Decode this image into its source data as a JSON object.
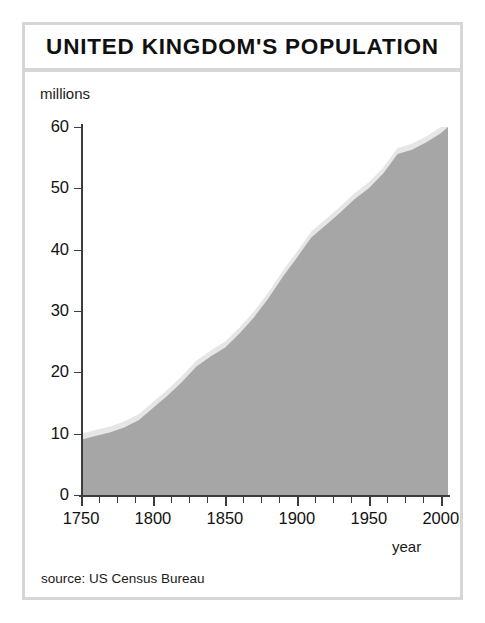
{
  "figure": {
    "title": "UNITED KINGDOM'S POPULATION",
    "source_note": "source: US Census Bureau",
    "frame_color": "#d6d6d6",
    "background_color": "#ffffff"
  },
  "chart_data": {
    "type": "area",
    "title": "UNITED KINGDOM'S POPULATION",
    "xlabel": "year",
    "ylabel": "millions",
    "xlim": [
      1750,
      2005
    ],
    "ylim": [
      0,
      60
    ],
    "grid": false,
    "legend": "none",
    "area_fill_color": "#a6a6a6",
    "area_edge_color": "#e0e0e0",
    "axis_color": "#3c3c3c",
    "x_major_ticks": [
      1750,
      1800,
      1850,
      1900,
      1950,
      2000
    ],
    "x_major_tick_labels": [
      "1750",
      "1800",
      "1850",
      "1900",
      "1950",
      "2000"
    ],
    "x_minor_tick_interval": 12.5,
    "y_ticks": [
      0,
      10,
      20,
      30,
      40,
      50,
      60
    ],
    "y_tick_labels": [
      "0",
      "10",
      "20",
      "30",
      "40",
      "50",
      "60"
    ],
    "x": [
      1750,
      1760,
      1770,
      1780,
      1790,
      1800,
      1810,
      1820,
      1830,
      1840,
      1850,
      1860,
      1870,
      1880,
      1890,
      1900,
      1910,
      1920,
      1930,
      1940,
      1950,
      1960,
      1970,
      1980,
      1990,
      2000,
      2005
    ],
    "values": [
      9.0,
      9.6,
      10.2,
      11.0,
      12.2,
      14.2,
      16.2,
      18.4,
      20.9,
      22.6,
      24.0,
      26.3,
      28.9,
      32.0,
      35.5,
      38.7,
      42.0,
      44.0,
      46.0,
      48.2,
      50.0,
      52.4,
      55.6,
      56.3,
      57.5,
      59.0,
      60.0
    ],
    "unit": "millions"
  },
  "y_axis": {
    "unit_label": "millions",
    "ticks": [
      {
        "label": "60",
        "value": 60
      },
      {
        "label": "50",
        "value": 50
      },
      {
        "label": "40",
        "value": 40
      },
      {
        "label": "30",
        "value": 30
      },
      {
        "label": "20",
        "value": 20
      },
      {
        "label": "10",
        "value": 10
      },
      {
        "label": "0",
        "value": 0
      }
    ]
  },
  "x_axis": {
    "name": "year",
    "ticks": [
      {
        "label": "1750",
        "value": 1750
      },
      {
        "label": "1800",
        "value": 1800
      },
      {
        "label": "1850",
        "value": 1850
      },
      {
        "label": "1900",
        "value": 1900
      },
      {
        "label": "1950",
        "value": 1950
      },
      {
        "label": "2000",
        "value": 2000
      }
    ]
  }
}
